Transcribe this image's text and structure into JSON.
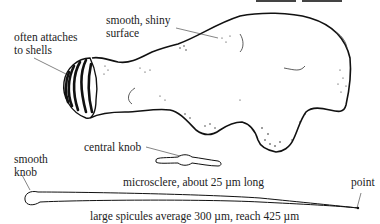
{
  "figure": {
    "labels": {
      "attach": [
        "often attaches",
        "to shells"
      ],
      "surface": [
        "smooth, shiny",
        "surface"
      ],
      "central_knob": "central knob",
      "smooth_knob": [
        "smooth",
        "knob"
      ],
      "microsclere": "microsclere, about 25 µm long",
      "point": "point",
      "large_spicules": "large spicules average 300 µm, reach 425 µm"
    },
    "colors": {
      "ink": "#1a1a1a",
      "background": "#ffffff"
    }
  }
}
